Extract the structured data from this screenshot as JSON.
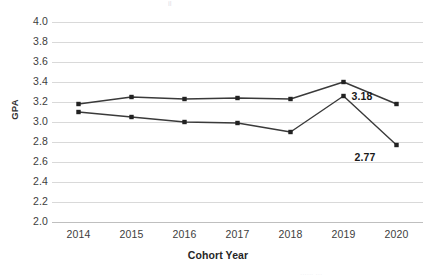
{
  "chart_data": {
    "type": "line",
    "title": "",
    "subtitle": "",
    "xlabel": "Cohort Year",
    "ylabel": "GPA",
    "categories": [
      "2014",
      "2015",
      "2016",
      "2017",
      "2018",
      "2019",
      "2020"
    ],
    "series": [
      {
        "name": "Series 1",
        "values": [
          3.18,
          3.25,
          3.23,
          3.24,
          3.23,
          3.4,
          3.18
        ]
      },
      {
        "name": "Series 2",
        "values": [
          3.1,
          3.05,
          3.0,
          2.99,
          2.9,
          3.26,
          2.77
        ]
      }
    ],
    "ylim": [
      2.0,
      4.0
    ],
    "ytick_step": 0.2,
    "ytick_labels": [
      "4.0",
      "3.8",
      "3.6",
      "3.4",
      "3.2",
      "3.0",
      "2.8",
      "2.6",
      "2.4",
      "2.2",
      "2.0"
    ],
    "grid": "horizontal",
    "legend": "none",
    "annotations": [
      {
        "text": "3.18",
        "series": 0,
        "category": "2020",
        "value": 3.18
      },
      {
        "text": "2.77",
        "series": 1,
        "category": "2020",
        "value": 2.77
      }
    ],
    "colors": {
      "series_line": "#3a3a3a",
      "marker": "#222222",
      "gridline": "#d9d9d9",
      "baseline": "#bfbfbf",
      "tick_text": "#3d3d3d",
      "axis_title": "#262626",
      "data_label": "#1a1a1a",
      "background": "#ffffff"
    }
  },
  "artifacts": {
    "top_clipped": "jl",
    "bottom_clipped": "......  ..."
  }
}
